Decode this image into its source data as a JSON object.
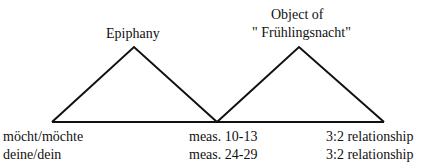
{
  "labels": {
    "left_peak": "Epiphany",
    "right_peak_line1": "Object of",
    "right_peak_line2": "\" Frühlingsnacht\""
  },
  "bottom": {
    "left": [
      "möcht/möchte",
      "deine/dein"
    ],
    "middle": [
      "meas. 10-13",
      "meas. 24-29"
    ],
    "right": [
      "3:2 relationship",
      "3:2 relationship"
    ]
  }
}
